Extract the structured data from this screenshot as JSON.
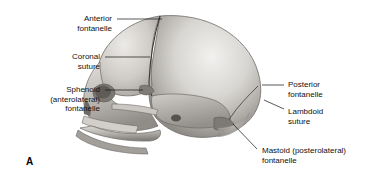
{
  "figure": {
    "panel_letter": "A",
    "background_color": "#ffffff",
    "leader_color": "#111111"
  },
  "labels": [
    {
      "id": "anterior-fontanelle",
      "text": "Anterior\nfontanelle",
      "side": "left",
      "x": 112,
      "y": 14,
      "leader": {
        "x1": 117,
        "y1": 19,
        "x2": 162,
        "y2": 19
      }
    },
    {
      "id": "coronal-suture",
      "text": "Coronal\nsuture",
      "side": "left",
      "x": 100,
      "y": 52,
      "leader": {
        "x1": 105,
        "y1": 57,
        "x2": 150,
        "y2": 57
      }
    },
    {
      "id": "sphenoid-fontanelle",
      "text": "Sphenoid\n(anterolateral)\nfontanelle",
      "side": "left",
      "x": 100,
      "y": 85,
      "leader": {
        "x1": 105,
        "y1": 90,
        "x2": 143,
        "y2": 90
      }
    },
    {
      "id": "posterior-fontanelle",
      "text": "Posterior\nfontanelle",
      "side": "right",
      "x": 288,
      "y": 80,
      "leader": {
        "x1": 284,
        "y1": 85,
        "x2": 262,
        "y2": 85
      }
    },
    {
      "id": "lambdoid-suture",
      "text": "Lambdoid\nsuture",
      "side": "right",
      "x": 288,
      "y": 107,
      "leader": {
        "x1": 284,
        "y1": 109,
        "x2": 264,
        "y2": 100
      }
    },
    {
      "id": "mastoid-fontanelle",
      "text": "Mastoid (posterolateral)\nfontanelle",
      "side": "right",
      "x": 262,
      "y": 146,
      "leader": {
        "x1": 257,
        "y1": 149,
        "x2": 233,
        "y2": 124
      }
    }
  ]
}
